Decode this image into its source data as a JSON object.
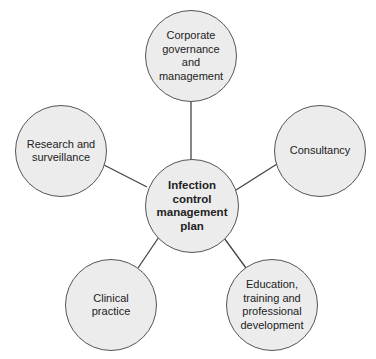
{
  "diagram": {
    "type": "hub-and-spoke",
    "center": {
      "label": "Infection\ncontrol\nmanagement\nplan"
    },
    "nodes": [
      {
        "id": "corporate",
        "label": "Corporate\ngovernance\nand\nmanagement"
      },
      {
        "id": "consultancy",
        "label": "Consultancy"
      },
      {
        "id": "education",
        "label": "Education,\ntraining and\nprofessional\ndevelopment"
      },
      {
        "id": "clinical",
        "label": "Clinical\npractice"
      },
      {
        "id": "research",
        "label": "Research and\nsurveillance"
      }
    ],
    "colors": {
      "fill": "#ececec",
      "stroke": "#555555",
      "text": "#222222"
    }
  }
}
